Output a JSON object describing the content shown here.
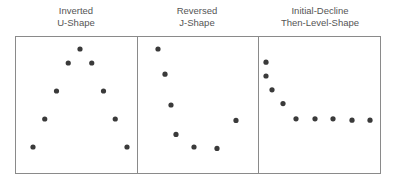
{
  "panels": [
    {
      "id": "inverted-u",
      "title_line1": "Inverted",
      "title_line2": "U-Shape",
      "points": [
        [
          0,
          0.0
        ],
        [
          1,
          0.2
        ],
        [
          2,
          0.4
        ],
        [
          3,
          0.6
        ],
        [
          4,
          0.7
        ],
        [
          5,
          0.6
        ],
        [
          6,
          0.4
        ],
        [
          7,
          0.2
        ],
        [
          8,
          0.0
        ]
      ]
    },
    {
      "id": "reversed-j",
      "title_line1": "Reversed",
      "title_line2": "J-Shape",
      "points": [
        [
          0,
          0.7
        ],
        [
          1,
          0.52
        ],
        [
          2,
          0.3
        ],
        [
          3,
          0.09
        ],
        [
          4,
          0.0
        ],
        [
          5,
          -0.01
        ],
        [
          6,
          0.19
        ]
      ]
    },
    {
      "id": "initial-decline-then-level",
      "title_line1": "Initial-Decline",
      "title_line2": "Then-Level-Shape",
      "points": [
        [
          0,
          0.6
        ],
        [
          0,
          0.5
        ],
        [
          1,
          0.4
        ],
        [
          2,
          0.3
        ],
        [
          3,
          0.19
        ],
        [
          4,
          0.19
        ],
        [
          5,
          0.19
        ],
        [
          6,
          0.18
        ],
        [
          7,
          0.18
        ]
      ]
    }
  ],
  "colors": {
    "dot": "#3a3a3a",
    "border": "#8a8a8a",
    "title": "#555555"
  }
}
